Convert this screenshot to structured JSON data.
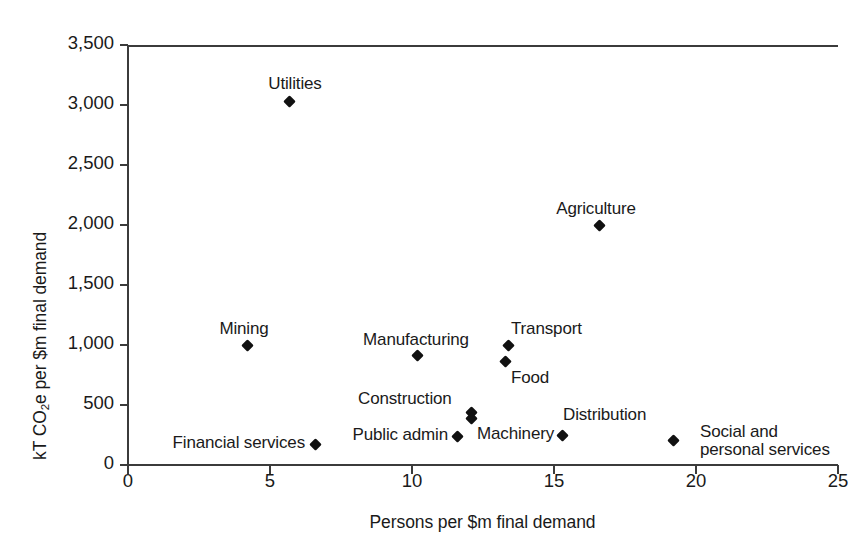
{
  "chart_data": {
    "type": "scatter",
    "title": "",
    "xlabel": "Persons per $m final demand",
    "ylabel_parts": {
      "pre": "kT CO",
      "sub": "2",
      "post": "e per $m final demand"
    },
    "ylabel": "kT CO2e per $m final demand",
    "xlim": [
      0,
      25
    ],
    "ylim": [
      0,
      3500
    ],
    "xticks": [
      "0",
      "5",
      "10",
      "15",
      "20",
      "25"
    ],
    "yticks": [
      "3,500",
      "3,000",
      "2,500",
      "2,000",
      "1,500",
      "1,000",
      "500",
      "0"
    ],
    "grid": false,
    "legend": "none",
    "marker_color": "#111111",
    "axis_color": "#3b3b3b",
    "points": [
      {
        "label": "Utilities",
        "x": 5.7,
        "y": 3030
      },
      {
        "label": "Agriculture",
        "x": 16.6,
        "y": 2000
      },
      {
        "label": "Mining",
        "x": 4.2,
        "y": 1000
      },
      {
        "label": "Transport",
        "x": 13.4,
        "y": 1000
      },
      {
        "label": "Manufacturing",
        "x": 10.2,
        "y": 910
      },
      {
        "label": "Food",
        "x": 13.3,
        "y": 860
      },
      {
        "label": "Construction",
        "x": 12.1,
        "y": 440
      },
      {
        "label": "Machinery",
        "x": 12.1,
        "y": 385
      },
      {
        "label": "Public admin",
        "x": 11.6,
        "y": 240
      },
      {
        "label": "Distribution",
        "x": 15.3,
        "y": 250
      },
      {
        "label": "Social and personal services",
        "x": 19.2,
        "y": 205
      },
      {
        "label": "Financial services",
        "x": 6.6,
        "y": 175
      }
    ]
  },
  "annotations": [
    {
      "name": "utilities",
      "text": "Utilities",
      "left": 255,
      "top": 75,
      "align": "center",
      "width": 80
    },
    {
      "name": "agriculture",
      "text": "Agriculture",
      "left": 538,
      "top": 200,
      "align": "center",
      "width": 116
    },
    {
      "name": "mining",
      "text": "Mining",
      "left": 204,
      "top": 320,
      "align": "center",
      "width": 80
    },
    {
      "name": "transport",
      "text": "Transport",
      "left": 511,
      "top": 320,
      "align": "left",
      "width": 100
    },
    {
      "name": "manufacturing",
      "text": "Manufacturing",
      "left": 356,
      "top": 331,
      "align": "center",
      "width": 120
    },
    {
      "name": "food",
      "text": "Food",
      "left": 511,
      "top": 369,
      "align": "left",
      "width": 60
    },
    {
      "name": "construction",
      "text": "Construction",
      "left": 358,
      "top": 390,
      "align": "left",
      "width": 120
    },
    {
      "name": "machinery",
      "text": "Machinery",
      "left": 477,
      "top": 425,
      "align": "left",
      "width": 100
    },
    {
      "name": "public-admin",
      "text": "Public admin",
      "left": 340,
      "top": 426,
      "align": "right",
      "width": 108
    },
    {
      "name": "distribution",
      "text": "Distribution",
      "left": 563,
      "top": 406,
      "align": "left",
      "width": 110
    },
    {
      "name": "social-services-l1",
      "text": "Social and",
      "left": 700,
      "top": 423,
      "align": "left",
      "width": 110
    },
    {
      "name": "social-services-l2",
      "text": "personal services",
      "left": 700,
      "top": 441,
      "align": "left",
      "width": 160
    },
    {
      "name": "financial-services",
      "text": "Financial services",
      "left": 155,
      "top": 434,
      "align": "right",
      "width": 150
    }
  ]
}
